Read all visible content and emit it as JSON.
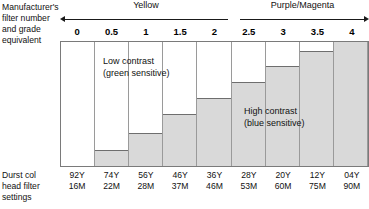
{
  "axis_labels": {
    "top_left": "Manufacturer's\nfilter number\nand grade\nequivalent",
    "bottom_left": "Durst col\nhead filter\nsettings"
  },
  "ranges": [
    {
      "name": "Yellow",
      "arrow": "double-left-pointing",
      "id": "yellow"
    },
    {
      "name": "Purple/Magenta",
      "arrow": "right-pointing",
      "id": "purple"
    }
  ],
  "notes": {
    "low": "Low contrast\n(green sensitive)",
    "high": "High contrast\n(blue sensitive)"
  },
  "colors": {
    "bar_fill": "#d9d9d9",
    "bar_edge": "#6e6e6e",
    "grid": "#9a9a9a",
    "frame": "#7a7a7a",
    "text": "#111111"
  },
  "chart_data": {
    "type": "bar",
    "title": "",
    "subtitle": "",
    "xlabel": "Manufacturer's filter number and grade equivalent",
    "ylabel": "",
    "grid": false,
    "legend_position": "none",
    "ylim": [
      0,
      100
    ],
    "categories": [
      "0",
      "0.5",
      "1",
      "1.5",
      "2",
      "2.5",
      "3",
      "3.5",
      "4"
    ],
    "values": [
      0,
      13,
      27,
      42,
      55,
      68,
      81,
      93,
      100
    ],
    "annotations": [
      {
        "text": "Low contrast (green sensitive)",
        "near_category": "0.5"
      },
      {
        "text": "High contrast (blue sensitive)",
        "near_category": "3"
      }
    ],
    "group_spans": [
      {
        "label": "Yellow",
        "from": "0",
        "to": "2"
      },
      {
        "label": "Purple/Magenta",
        "from": "2.5",
        "to": "4"
      }
    ],
    "secondary_axis": {
      "label": "Durst col head filter settings",
      "values": [
        {
          "yellow": "92Y",
          "magenta": "16M"
        },
        {
          "yellow": "74Y",
          "magenta": "22M"
        },
        {
          "yellow": "56Y",
          "magenta": "28M"
        },
        {
          "yellow": "46Y",
          "magenta": "37M"
        },
        {
          "yellow": "36Y",
          "magenta": "46M"
        },
        {
          "yellow": "28Y",
          "magenta": "53M"
        },
        {
          "yellow": "20Y",
          "magenta": "60M"
        },
        {
          "yellow": "12Y",
          "magenta": "75M"
        },
        {
          "yellow": "04Y",
          "magenta": "90M"
        }
      ]
    }
  }
}
